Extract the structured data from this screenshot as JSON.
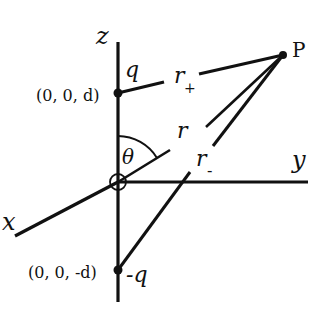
{
  "diagram": {
    "type": "electric-dipole-geometry",
    "axes": {
      "z": {
        "label": "z"
      },
      "y": {
        "label": "y"
      },
      "x": {
        "label": "x"
      }
    },
    "charges": {
      "positive": {
        "label": "q",
        "coord_label": "(0, 0, d)"
      },
      "negative": {
        "label": "-q",
        "coord_label": "(0, 0, -d)"
      }
    },
    "point": {
      "label": "P"
    },
    "distances": {
      "r_plus": {
        "symbol": "r",
        "subscript": "+"
      },
      "r": {
        "symbol": "r"
      },
      "r_minus": {
        "symbol": "r",
        "subscript": "-"
      }
    },
    "angle": {
      "label": "θ"
    },
    "colors": {
      "ink": "#111111",
      "background": "#ffffff"
    }
  }
}
